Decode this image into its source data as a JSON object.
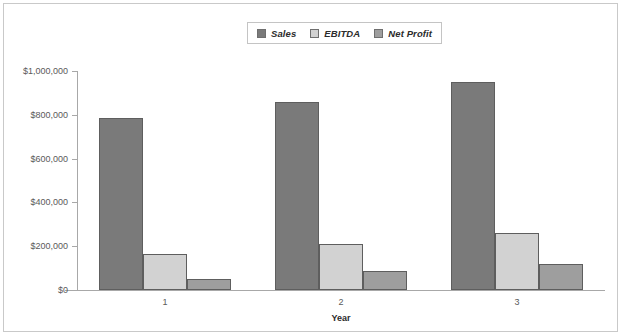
{
  "chart_data": {
    "type": "bar",
    "title": "",
    "subtitle": "",
    "xlabel": "Year",
    "ylabel": "",
    "categories": [
      "1",
      "2",
      "3"
    ],
    "series": [
      {
        "name": "Sales",
        "values": [
          785000,
          860000,
          950000
        ],
        "color": "#7a7a7a"
      },
      {
        "name": "EBITDA",
        "values": [
          163000,
          210000,
          262000
        ],
        "color": "#d2d2d2"
      },
      {
        "name": "Net Profit",
        "values": [
          50000,
          88000,
          120000
        ],
        "color": "#9e9e9e"
      }
    ],
    "ylim": [
      0,
      1000000
    ],
    "y_ticks": [
      0,
      200000,
      400000,
      600000,
      800000,
      1000000
    ],
    "y_tick_labels": [
      "$0",
      "$200,000",
      "$400,000",
      "$600,000",
      "$800,000",
      "$1,000,000"
    ],
    "grid": false,
    "legend_position": "top-center",
    "bar_border_color": "#5e5e5e",
    "axis_color": "#a8a8a8",
    "background": "#ffffff",
    "frame_color": "#c9c9c9"
  },
  "legend": {
    "items": [
      {
        "label": "Sales",
        "swatch": "legend-swatch-sales"
      },
      {
        "label": "EBITDA",
        "swatch": "legend-swatch-ebitda"
      },
      {
        "label": "Net Profit",
        "swatch": "legend-swatch-net-profit"
      }
    ]
  }
}
